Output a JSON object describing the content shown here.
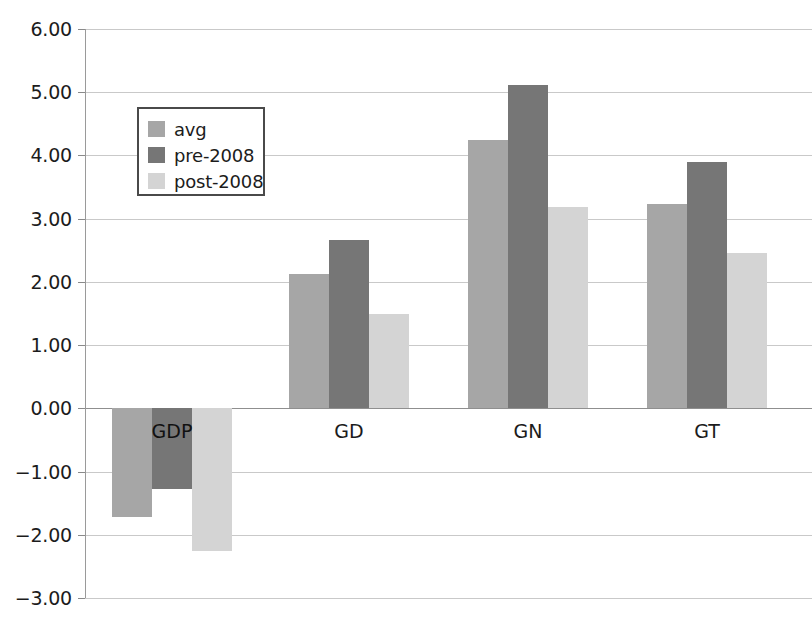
{
  "chart_data": {
    "type": "bar",
    "title": "",
    "subtitle": "",
    "xlabel": "",
    "ylabel": "",
    "categories": [
      "GDP",
      "GD",
      "GN",
      "GT"
    ],
    "series": [
      {
        "name": "avg",
        "values": [
          -1.72,
          2.12,
          4.25,
          3.23
        ],
        "color": "#a6a6a6"
      },
      {
        "name": "pre-2008",
        "values": [
          -1.27,
          2.67,
          5.12,
          3.89
        ],
        "color": "#767676"
      },
      {
        "name": "post-2008",
        "values": [
          -2.26,
          1.5,
          3.18,
          2.45
        ],
        "color": "#d4d4d4"
      }
    ],
    "ylim": [
      -3.0,
      6.0
    ],
    "ytick_values": [
      6.0,
      5.0,
      4.0,
      3.0,
      2.0,
      1.0,
      0.0,
      -1.0,
      -2.0,
      -3.0
    ],
    "ytick_labels": [
      "6.00",
      "5.00",
      "4.00",
      "3.00",
      "2.00",
      "1.00",
      "0.00",
      "-1.00",
      "-2.00",
      "-3.00"
    ],
    "grid": true,
    "legend_position": "upper-left-inside",
    "gridline_color": "#c9c9c9",
    "axis_color": "#9a9a9a",
    "background_color": "#ffffff"
  },
  "legend": {
    "entries": [
      {
        "label": "avg"
      },
      {
        "label": "pre-2008"
      },
      {
        "label": "post-2008"
      }
    ]
  }
}
